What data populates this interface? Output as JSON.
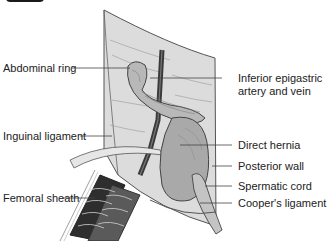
{
  "figure": {
    "type": "anatomical-illustration",
    "colors": {
      "background": "#ffffff",
      "wall": "#d9d9d9",
      "wall_edge": "#555555",
      "hernia_sac": "#a9a9a9",
      "vessel": "#3a3a3a",
      "femoral_dark": "#2e2e2e",
      "label_text": "#222222",
      "leader_line": "#444444"
    }
  },
  "labels": {
    "left": [
      {
        "text": "Abdominal ring"
      },
      {
        "text": "Inguinal ligament"
      },
      {
        "text": "Femoral sheath"
      }
    ],
    "right": [
      {
        "line1": "Inferior epigastric",
        "line2": "artery and vein"
      },
      {
        "text": "Direct hernia"
      },
      {
        "text": "Posterior wall"
      },
      {
        "text": "Spermatic cord"
      },
      {
        "text": "Cooper's ligament"
      }
    ]
  }
}
